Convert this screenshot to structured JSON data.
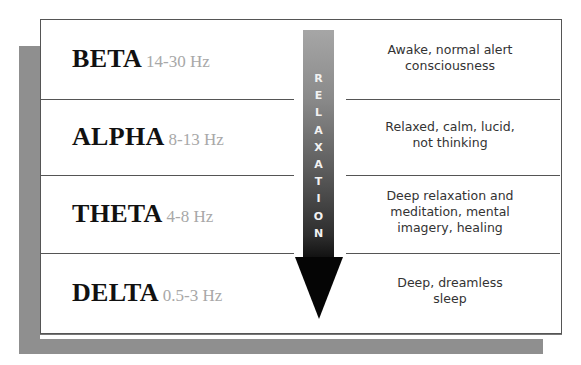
{
  "diagram": {
    "arrow": {
      "label": "RELAXATION",
      "letters": [
        "R",
        "E",
        "L",
        "A",
        "X",
        "A",
        "T",
        "I",
        "O",
        "N"
      ],
      "direction": "down"
    },
    "rows": [
      {
        "band": "BETA",
        "frequency": "14-30 Hz",
        "description_lines": [
          "Awake, normal alert",
          "consciousness"
        ]
      },
      {
        "band": "ALPHA",
        "frequency": "8-13 Hz",
        "description_lines": [
          "Relaxed, calm, lucid,",
          "not thinking"
        ]
      },
      {
        "band": "THETA",
        "frequency": "4-8 Hz",
        "description_lines": [
          "Deep relaxation and",
          "meditation, mental",
          "imagery, healing"
        ]
      },
      {
        "band": "DELTA",
        "frequency": "0.5-3 Hz",
        "description_lines": [
          "Deep, dreamless",
          "sleep"
        ]
      }
    ],
    "colors": {
      "shadow": "#8f8f8f",
      "band_text": "#111111",
      "frequency_text": "#a8a8a8",
      "description_text": "#333333",
      "border": "#555555"
    }
  }
}
